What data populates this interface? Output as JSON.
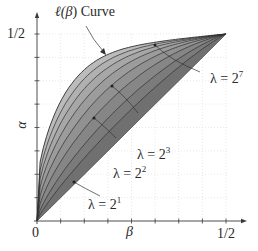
{
  "chart_data": {
    "type": "area",
    "title": "",
    "xlabel": "β",
    "ylabel": "α",
    "xlim": [
      0,
      0.5
    ],
    "ylim": [
      0,
      0.5
    ],
    "x_ticks": [
      "0",
      "1/2"
    ],
    "y_ticks": [
      "1/2"
    ],
    "tick_count": 8,
    "grid": "dotted",
    "region": "area between diagonal α=β and the ℓ(β) curve, shaded gray",
    "curve_annotation": "ℓ(β) Curve",
    "series": [
      {
        "name": "λ = 2^1",
        "lambda": 2
      },
      {
        "name": "λ = 2^2",
        "lambda": 4
      },
      {
        "name": "λ = 2^3",
        "lambda": 8
      },
      {
        "name": "λ = 2^4",
        "lambda": 16
      },
      {
        "name": "λ = 2^5",
        "lambda": 32
      },
      {
        "name": "λ = 2^6",
        "lambda": 64
      },
      {
        "name": "λ = 2^7",
        "lambda": 128
      },
      {
        "name": "ℓ(β)",
        "lambda": "∞"
      }
    ],
    "annotations": [
      {
        "text": "λ = 2^7",
        "points_to": "λ = 2^7"
      },
      {
        "text": "λ = 2^3",
        "points_to": "λ = 2^3"
      },
      {
        "text": "λ = 2^2",
        "points_to": "λ = 2^2"
      },
      {
        "text": "λ = 2^1",
        "points_to": "λ = 2^1"
      }
    ]
  },
  "labels": {
    "curve_title_prefix": "ℓ(",
    "curve_title_beta": "β",
    "curve_title_suffix": ") Curve",
    "y_tick_half": "1/2",
    "x_tick_zero": "0",
    "x_tick_half": "1/2",
    "x_axis": "β",
    "y_axis": "α",
    "lambda": "λ = 2",
    "lam7_exp": "7",
    "lam3_exp": "3",
    "lam2_exp": "2",
    "lam1_exp": "1"
  },
  "colors": {
    "fill_light": "#b4b4b4",
    "fill_dark": "#6e6e6e",
    "curve": "#2e2e2e",
    "axis": "#3a3a3a",
    "grid": "#d8d8d8"
  }
}
